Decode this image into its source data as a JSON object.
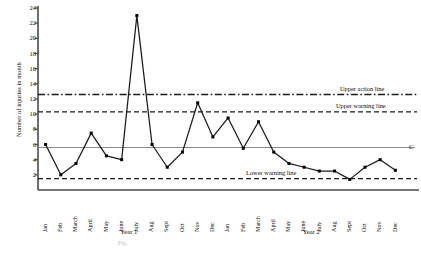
{
  "chart_data": {
    "type": "line",
    "title": "",
    "xlabel": "",
    "ylabel": "Number of injuries in month",
    "ylim": [
      0,
      24
    ],
    "yticks": [
      2,
      4,
      6,
      8,
      10,
      12,
      14,
      16,
      18,
      20,
      22,
      24
    ],
    "grid": false,
    "legend": "none",
    "categories": [
      "Jan",
      "Feb",
      "March",
      "April",
      "May",
      "June",
      "July",
      "Aug",
      "Sept",
      "Oct",
      "Nov",
      "Dec",
      "Jan",
      "Feb",
      "March",
      "April",
      "May",
      "June",
      "July",
      "Aug",
      "Sept",
      "Oct",
      "Nov",
      "Dec"
    ],
    "group_labels": [
      "Year 1",
      "Year 2"
    ],
    "series": [
      {
        "name": "Number of injuries in month",
        "values": [
          6,
          2,
          3.5,
          7.5,
          4.5,
          4,
          23,
          6,
          3,
          5,
          11.5,
          7,
          9.5,
          5.5,
          9,
          5,
          3.5,
          3,
          2.5,
          2.5,
          1.4,
          3,
          4,
          2.6
        ]
      }
    ],
    "reference_lines": [
      {
        "id": "upper-action-line",
        "label": "Upper action line",
        "value": 12.6,
        "style": "dash-dot"
      },
      {
        "id": "upper-warning-line",
        "label": "Upper warning line",
        "value": 10.3,
        "style": "dashed"
      },
      {
        "id": "centre-line",
        "label": "C",
        "value": 5.6,
        "style": "solid"
      },
      {
        "id": "lower-warning-line",
        "label": "Lower warning line",
        "value": 1.5,
        "style": "dashed"
      }
    ],
    "colors": {
      "data_line": "#1a1a1a",
      "marker": "#000000",
      "axis": "#4a4a4a",
      "centre_line": "#8a8a8a",
      "reference_line": "#1a1a1a"
    }
  },
  "caption": "Fig."
}
